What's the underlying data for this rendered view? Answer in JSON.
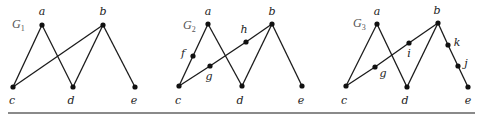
{
  "figure": {
    "rule_color": "#8a8a8a",
    "graphs": [
      {
        "id": "G1",
        "label": "G",
        "subscript": "1",
        "label_pos": [
          12,
          28
        ],
        "nodes": [
          {
            "name": "a",
            "x": 42,
            "y": 25,
            "lx": 42,
            "ly": 15
          },
          {
            "name": "b",
            "x": 103,
            "y": 25,
            "lx": 103,
            "ly": 15
          },
          {
            "name": "c",
            "x": 13,
            "y": 87,
            "lx": 12,
            "ly": 104
          },
          {
            "name": "d",
            "x": 73,
            "y": 87,
            "lx": 71,
            "ly": 104
          },
          {
            "name": "e",
            "x": 135,
            "y": 87,
            "lx": 134,
            "ly": 104
          }
        ],
        "edges": [
          [
            "a",
            "c"
          ],
          [
            "a",
            "d"
          ],
          [
            "b",
            "c"
          ],
          [
            "b",
            "d"
          ],
          [
            "b",
            "e"
          ]
        ]
      },
      {
        "id": "G2",
        "label": "G",
        "subscript": "2",
        "label_pos": [
          183,
          29
        ],
        "nodes": [
          {
            "name": "a",
            "x": 208,
            "y": 24,
            "lx": 208,
            "ly": 15
          },
          {
            "name": "b",
            "x": 272,
            "y": 24,
            "lx": 272,
            "ly": 15
          },
          {
            "name": "c",
            "x": 179,
            "y": 86,
            "lx": 178,
            "ly": 104
          },
          {
            "name": "d",
            "x": 242,
            "y": 86,
            "lx": 240,
            "ly": 104
          },
          {
            "name": "e",
            "x": 302,
            "y": 86,
            "lx": 301,
            "ly": 104
          },
          {
            "name": "f",
            "x": 193,
            "y": 56,
            "lx": 183,
            "ly": 57
          },
          {
            "name": "g",
            "x": 210,
            "y": 66,
            "lx": 209,
            "ly": 80
          },
          {
            "name": "h",
            "x": 246,
            "y": 42,
            "lx": 244,
            "ly": 33
          }
        ],
        "edges": [
          [
            "a",
            "f"
          ],
          [
            "f",
            "c"
          ],
          [
            "a",
            "d"
          ],
          [
            "c",
            "g"
          ],
          [
            "g",
            "h"
          ],
          [
            "h",
            "b"
          ],
          [
            "b",
            "d"
          ],
          [
            "b",
            "e"
          ]
        ]
      },
      {
        "id": "G3",
        "label": "G",
        "subscript": "3",
        "label_pos": [
          353,
          27
        ],
        "nodes": [
          {
            "name": "a",
            "x": 377,
            "y": 24,
            "lx": 377,
            "ly": 15
          },
          {
            "name": "b",
            "x": 438,
            "y": 23,
            "lx": 437,
            "ly": 14
          },
          {
            "name": "c",
            "x": 346,
            "y": 86,
            "lx": 344,
            "ly": 104
          },
          {
            "name": "d",
            "x": 407,
            "y": 87,
            "lx": 405,
            "ly": 104
          },
          {
            "name": "e",
            "x": 468,
            "y": 87,
            "lx": 468,
            "ly": 104
          },
          {
            "name": "g",
            "x": 375,
            "y": 67,
            "lx": 383,
            "ly": 77
          },
          {
            "name": "i",
            "x": 409,
            "y": 43,
            "lx": 409,
            "ly": 57
          },
          {
            "name": "k",
            "x": 448,
            "y": 45,
            "lx": 457,
            "ly": 46
          },
          {
            "name": "j",
            "x": 458,
            "y": 66,
            "lx": 466,
            "ly": 67
          }
        ],
        "edges": [
          [
            "a",
            "c"
          ],
          [
            "a",
            "d"
          ],
          [
            "c",
            "g"
          ],
          [
            "g",
            "i"
          ],
          [
            "i",
            "b"
          ],
          [
            "b",
            "d"
          ],
          [
            "b",
            "k"
          ],
          [
            "k",
            "j"
          ],
          [
            "j",
            "e"
          ]
        ]
      }
    ]
  }
}
